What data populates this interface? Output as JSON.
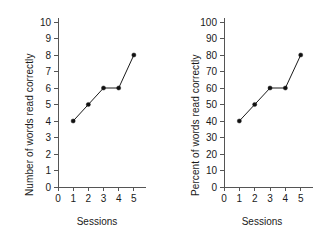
{
  "figure": {
    "background": "#ffffff",
    "axis_color": "#555555",
    "series_color": "#111111"
  },
  "chart_data": [
    {
      "type": "line",
      "title": "",
      "panel": "left",
      "xlabel": "Sessions",
      "ylabel": "Number of words read correctly",
      "x": [
        1,
        2,
        3,
        4,
        5
      ],
      "values": [
        4,
        5,
        6,
        6,
        8
      ],
      "xlim": [
        0,
        5.8
      ],
      "ylim": [
        0,
        10
      ],
      "xticks": [
        0,
        1,
        2,
        3,
        4,
        5
      ],
      "yticks": [
        0,
        1,
        2,
        3,
        4,
        5,
        6,
        7,
        8,
        9,
        10
      ],
      "xticklabels": [
        "0",
        "1",
        "2",
        "3",
        "4",
        "5"
      ],
      "yticklabels": [
        "0",
        "1",
        "2",
        "3",
        "4",
        "5",
        "6",
        "7",
        "8",
        "9",
        "10"
      ],
      "grid": false,
      "legend": null,
      "marker": "filled-circle",
      "series": [
        {
          "name": "words read correctly",
          "values": [
            4,
            5,
            6,
            6,
            8
          ]
        }
      ]
    },
    {
      "type": "line",
      "title": "",
      "panel": "right",
      "xlabel": "Sessions",
      "ylabel": "Percent of words read correctly",
      "x": [
        1,
        2,
        3,
        4,
        5
      ],
      "values": [
        40,
        50,
        60,
        60,
        80
      ],
      "xlim": [
        0,
        5.8
      ],
      "ylim": [
        0,
        100
      ],
      "xticks": [
        0,
        1,
        2,
        3,
        4,
        5
      ],
      "yticks": [
        0,
        10,
        20,
        30,
        40,
        50,
        60,
        70,
        80,
        90,
        100
      ],
      "xticklabels": [
        "0",
        "1",
        "2",
        "3",
        "4",
        "5"
      ],
      "yticklabels": [
        "0",
        "10",
        "20",
        "30",
        "40",
        "50",
        "60",
        "70",
        "80",
        "90",
        "100"
      ],
      "grid": false,
      "legend": null,
      "marker": "filled-circle",
      "series": [
        {
          "name": "percent of words read correctly",
          "values": [
            40,
            50,
            60,
            60,
            80
          ]
        }
      ]
    }
  ]
}
